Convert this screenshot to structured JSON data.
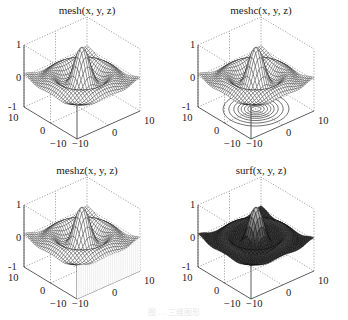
{
  "chart_data": [
    {
      "type": "surface-mesh",
      "title": "mesh(x, y, z)",
      "function": "z = sin(r)/r, r = sqrt(x^2+y^2)",
      "xlim": [
        -10,
        10
      ],
      "ylim": [
        -10,
        10
      ],
      "zlim": [
        -1,
        1
      ],
      "xticks": [
        "-10",
        "0",
        "10"
      ],
      "yticks": [
        "-10",
        "0",
        "10"
      ],
      "zticks": [
        "-1",
        "0",
        "1"
      ],
      "grid": true,
      "style": "mesh"
    },
    {
      "type": "surface-mesh-contour",
      "title": "meshc(x, y, z)",
      "function": "z = sin(r)/r, r = sqrt(x^2+y^2)",
      "xlim": [
        -10,
        10
      ],
      "ylim": [
        -10,
        10
      ],
      "zlim": [
        -1,
        1
      ],
      "xticks": [
        "-10",
        "0",
        "10"
      ],
      "yticks": [
        "-10",
        "0",
        "10"
      ],
      "zticks": [
        "-1",
        "0",
        "1"
      ],
      "grid": true,
      "style": "meshc"
    },
    {
      "type": "surface-mesh-curtain",
      "title": "meshz(x, y, z)",
      "function": "z = sin(r)/r, r = sqrt(x^2+y^2)",
      "xlim": [
        -10,
        10
      ],
      "ylim": [
        -10,
        10
      ],
      "zlim": [
        -1,
        1
      ],
      "xticks": [
        "-10",
        "0",
        "10"
      ],
      "yticks": [
        "-10",
        "0",
        "10"
      ],
      "zticks": [
        "-1",
        "0",
        "1"
      ],
      "grid": true,
      "style": "meshz"
    },
    {
      "type": "surface",
      "title": "surf(x, y, z)",
      "function": "z = sin(r)/r, r = sqrt(x^2+y^2)",
      "xlim": [
        -10,
        10
      ],
      "ylim": [
        -10,
        10
      ],
      "zlim": [
        -1,
        1
      ],
      "xticks": [
        "-10",
        "0",
        "10"
      ],
      "yticks": [
        "-10",
        "0",
        "10"
      ],
      "zticks": [
        "-1",
        "0",
        "1"
      ],
      "grid": true,
      "style": "surf"
    }
  ],
  "panels": [
    {
      "title": "mesh(x, y, z)"
    },
    {
      "title": "meshc(x, y, z)"
    },
    {
      "title": "meshz(x, y, z)"
    },
    {
      "title": "surf(x, y, z)"
    }
  ],
  "ticks": {
    "z_top": "1",
    "z_mid": "0",
    "z_bot": "-1",
    "y_left": "10",
    "y_mid": "0",
    "y_front": "−10",
    "x_front": "−10",
    "x_mid": "0",
    "x_right": "10"
  },
  "caption": "图 … 三维图形"
}
